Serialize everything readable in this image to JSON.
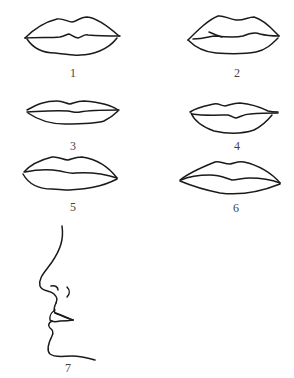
{
  "figure": {
    "line_color": "#1a1a1a",
    "label_color": "#444444",
    "items": [
      {
        "id": 1,
        "label": "1",
        "kind": "lips-front"
      },
      {
        "id": 2,
        "label": "2",
        "kind": "lips-front"
      },
      {
        "id": 3,
        "label": "3",
        "kind": "lips-front"
      },
      {
        "id": 4,
        "label": "4",
        "kind": "lips-front"
      },
      {
        "id": 5,
        "label": "5",
        "kind": "lips-front"
      },
      {
        "id": 6,
        "label": "6",
        "kind": "lips-front"
      },
      {
        "id": 7,
        "label": "7",
        "kind": "face-profile"
      }
    ]
  }
}
